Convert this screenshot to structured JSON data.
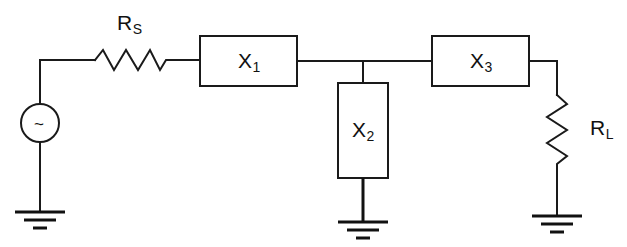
{
  "diagram": {
    "type": "electrical-schematic",
    "background_color": "#ffffff",
    "line_color": "#1a1a1a"
  },
  "components": {
    "source": {
      "name": "ac-voltage-source",
      "symbol": "~",
      "label": "",
      "center": [
        40,
        123
      ],
      "radius": 19
    },
    "series_resistor": {
      "name": "source-resistor",
      "label_main": "R",
      "label_sub": "S",
      "label_text": "RS",
      "orientation": "horizontal"
    },
    "load_resistor": {
      "name": "load-resistor",
      "label_main": "R",
      "label_sub": "L",
      "label_text": "RL",
      "orientation": "vertical"
    },
    "boxes": [
      {
        "name": "reactance-x1",
        "label_main": "X",
        "label_sub": "1",
        "label_text": "X1",
        "orientation": "horizontal",
        "x": 200,
        "y": 36,
        "w": 97,
        "h": 50
      },
      {
        "name": "reactance-x2",
        "label_main": "X",
        "label_sub": "2",
        "label_text": "X2",
        "orientation": "vertical",
        "x": 338,
        "y": 83,
        "w": 50,
        "h": 95
      },
      {
        "name": "reactance-x3",
        "label_main": "X",
        "label_sub": "3",
        "label_text": "X3",
        "orientation": "horizontal",
        "x": 432,
        "y": 36,
        "w": 97,
        "h": 50
      }
    ],
    "grounds": [
      {
        "name": "ground-source",
        "x": 40,
        "y": 212
      },
      {
        "name": "ground-x2",
        "x": 363,
        "y": 222
      },
      {
        "name": "ground-load",
        "x": 557,
        "y": 216
      }
    ],
    "node": {
      "name": "junction-node",
      "x": 363,
      "y": 62
    }
  }
}
